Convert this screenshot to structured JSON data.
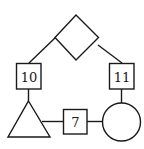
{
  "diagram": {
    "nodes": [
      {
        "id": "diamond",
        "shape": "diamond",
        "label": ""
      },
      {
        "id": "box10",
        "shape": "square",
        "label": "10"
      },
      {
        "id": "box11",
        "shape": "square",
        "label": "11"
      },
      {
        "id": "triangle",
        "shape": "triangle",
        "label": ""
      },
      {
        "id": "box7",
        "shape": "square",
        "label": "7"
      },
      {
        "id": "circle",
        "shape": "circle",
        "label": ""
      }
    ],
    "edges": [
      {
        "from": "diamond",
        "to": "box10"
      },
      {
        "from": "diamond",
        "to": "box11"
      },
      {
        "from": "box10",
        "to": "triangle"
      },
      {
        "from": "box11",
        "to": "circle"
      },
      {
        "from": "triangle",
        "to": "box7"
      },
      {
        "from": "box7",
        "to": "circle"
      }
    ]
  }
}
